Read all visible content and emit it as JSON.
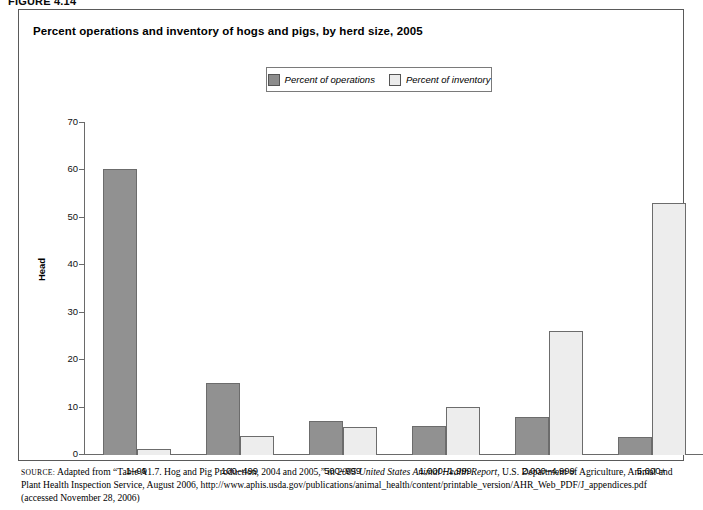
{
  "figure_label": "FIGURE 4.14",
  "chart_title": "Percent operations and inventory of hogs and pigs, by herd size, 2005",
  "legend": {
    "items": [
      {
        "label": "Percent of operations",
        "color": "#8c8c8c",
        "swatch": "ops-swatch"
      },
      {
        "label": "Percent of inventory",
        "color": "#ececec",
        "swatch": "inv-swatch"
      }
    ]
  },
  "source_note": {
    "prefix": "SOURCE:",
    "part1": " Adapted from “Table A1.7. Hog and Pig Production, 2004 and 2005,” in ",
    "italic_title": "2005 United States Animal Health Report",
    "part2": ", U.S. Department of Agriculture, Animal and Plant Health Inspection Service, August 2006, http://www.aphis.usda.gov/publications/animal_health/content/printable_version/AHR_Web_PDF/J_appendices.pdf (accessed November 28, 2006)"
  },
  "chart_data": {
    "type": "bar",
    "title": "Percent operations and inventory of hogs and pigs, by herd size, 2005",
    "xlabel": "",
    "ylabel": "Head",
    "ylim": [
      0,
      70
    ],
    "yticks": [
      0,
      10,
      20,
      30,
      40,
      50,
      60,
      70
    ],
    "grid": false,
    "legend_position": "top-center",
    "categories": [
      "1–99",
      "100–499",
      "500–999",
      "1,000–1,999",
      "2,000–4,999",
      "5,000+"
    ],
    "series": [
      {
        "name": "Percent of operations",
        "color": "#919191",
        "values": [
          60.2,
          15.1,
          7.1,
          6.2,
          8.0,
          3.8
        ]
      },
      {
        "name": "Percent of inventory",
        "color": "#ededed",
        "values": [
          1.2,
          4.1,
          6.0,
          10.2,
          26.2,
          53.1
        ]
      }
    ]
  }
}
